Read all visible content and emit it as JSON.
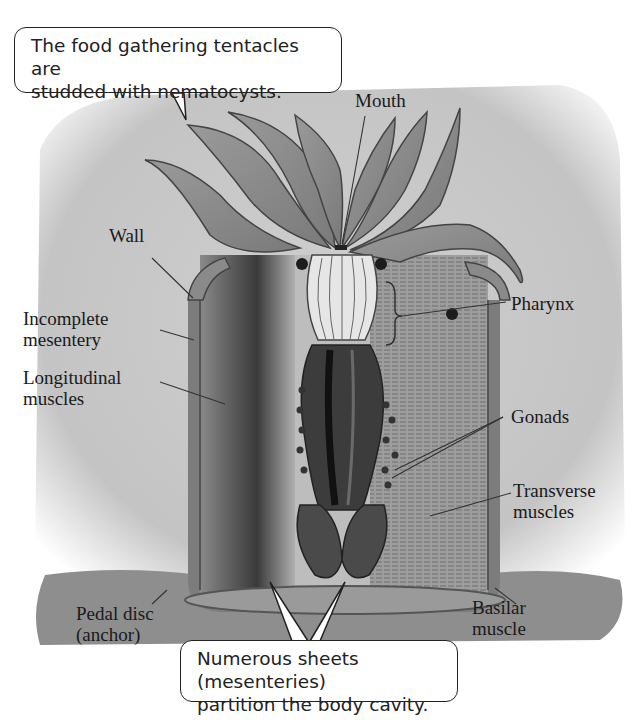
{
  "figure": {
    "colors": {
      "background_card": "#c9c9c9",
      "body_fill": "#a9a9a9",
      "dark_tissue": "#3a3a3a",
      "ground": "#8c8c8c",
      "callout_bg": "#ffffff",
      "label_text": "#1a1a1a"
    }
  },
  "callouts": {
    "top": {
      "line1": "The food gathering tentacles are",
      "line2": "studded with nematocysts."
    },
    "bottom": {
      "line1": "Numerous sheets (mesenteries)",
      "line2": "partition the body cavity."
    }
  },
  "labels": {
    "mouth": "Mouth",
    "wall": "Wall",
    "incomplete_mesentery": {
      "line1": "Incomplete",
      "line2": "mesentery"
    },
    "longitudinal_muscles": {
      "line1": "Longitudinal",
      "line2": "muscles"
    },
    "pharynx": "Pharynx",
    "gonads": "Gonads",
    "transverse_muscles": {
      "line1": "Transverse",
      "line2": "muscles"
    },
    "pedal_disc": {
      "line1": "Pedal disc",
      "line2": "(anchor)"
    },
    "basilar_muscle": {
      "line1": "Basilar",
      "line2": "muscle"
    }
  }
}
